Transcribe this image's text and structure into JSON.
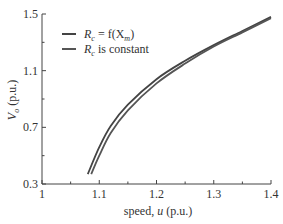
{
  "chart_data": {
    "type": "line",
    "title": "",
    "xlabel": "speed, u (p.u.)",
    "ylabel": "V_o (p.u.)",
    "xlim": [
      1.0,
      1.4
    ],
    "ylim": [
      0.3,
      1.5
    ],
    "xticks": [
      "1",
      "1.1",
      "1.2",
      "1.3",
      "1.4"
    ],
    "yticks": [
      "0.3",
      "0.7",
      "1.1",
      "1.5"
    ],
    "grid": false,
    "legend_position": "upper left",
    "series": [
      {
        "name": "R_c = f(X_m)",
        "color": "#444444",
        "x": [
          1.08,
          1.1,
          1.12,
          1.15,
          1.2,
          1.25,
          1.3,
          1.35,
          1.4
        ],
        "y": [
          0.37,
          0.56,
          0.71,
          0.86,
          1.04,
          1.17,
          1.28,
          1.38,
          1.48
        ]
      },
      {
        "name": "R_c is constant",
        "color": "#555555",
        "x": [
          1.086,
          1.1,
          1.12,
          1.15,
          1.2,
          1.25,
          1.3,
          1.35,
          1.4
        ],
        "y": [
          0.37,
          0.5,
          0.66,
          0.82,
          1.01,
          1.15,
          1.27,
          1.37,
          1.47
        ]
      }
    ]
  },
  "legend": {
    "items": [
      {
        "main": "R",
        "sub": "c",
        "rest": " = f(X",
        "sub2": "m",
        "tail": ")"
      },
      {
        "main": "R",
        "sub": "c",
        "rest": " is constant"
      }
    ]
  },
  "axes": {
    "xlabel_prefix": "speed, ",
    "xlabel_var": "u",
    "xlabel_suffix": " (p.u.)",
    "ylabel_var": "V",
    "ylabel_sub": "o",
    "ylabel_suffix": " (p.u.)"
  }
}
